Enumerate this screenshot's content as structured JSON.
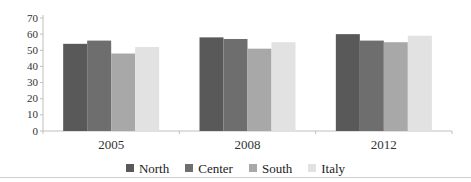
{
  "figure": {
    "background": "#ffffff",
    "bottom_rule_color": "#cfcfcf"
  },
  "chart_data": {
    "type": "bar",
    "title": "",
    "xlabel": "",
    "ylabel": "",
    "categories": [
      "2005",
      "2008",
      "2012"
    ],
    "series": [
      {
        "name": "North",
        "color": "#595959",
        "values": [
          54,
          58,
          60
        ]
      },
      {
        "name": "Center",
        "color": "#6e6e6e",
        "values": [
          56,
          57,
          56
        ]
      },
      {
        "name": "South",
        "color": "#a8a8a8",
        "values": [
          48,
          51,
          55
        ]
      },
      {
        "name": "Italy",
        "color": "#e2e2e2",
        "values": [
          52,
          55,
          59
        ]
      }
    ],
    "ylim": [
      0,
      70
    ],
    "ytick_step": 10,
    "ytick_labels": [
      "0",
      "10",
      "20",
      "30",
      "40",
      "50",
      "60",
      "70"
    ],
    "grid": false,
    "legend_position": "bottom",
    "axis_color": "#bfbfbf",
    "text_color": "#333333"
  }
}
